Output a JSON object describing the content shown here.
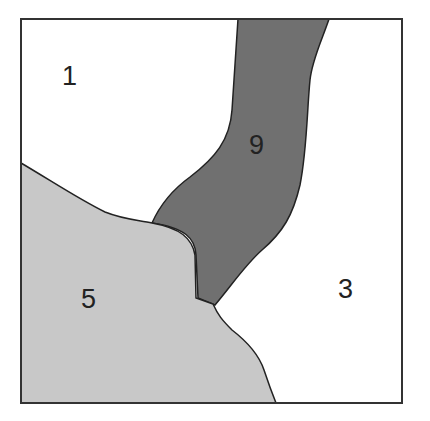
{
  "diagram": {
    "type": "region-map",
    "colors": {
      "background": "#ffffff",
      "border": "#333333",
      "light_gray": "#c8c8c8",
      "dark_gray": "#707070",
      "white": "#ffffff"
    },
    "regions": [
      {
        "id": "1",
        "label": "1",
        "fill": "white",
        "position": "top-left"
      },
      {
        "id": "9",
        "label": "9",
        "fill": "dark_gray",
        "position": "top-center band"
      },
      {
        "id": "5",
        "label": "5",
        "fill": "light_gray",
        "position": "bottom-left"
      },
      {
        "id": "3",
        "label": "3",
        "fill": "white",
        "position": "right"
      }
    ]
  }
}
